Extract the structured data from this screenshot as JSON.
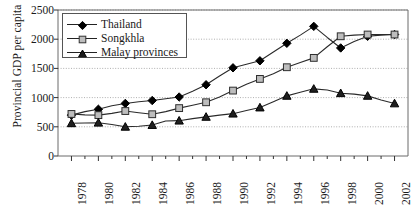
{
  "chart_data": {
    "type": "line",
    "title": "",
    "xlabel": "",
    "ylabel": "Provincial GDP per capita",
    "xlim": [
      1977,
      2003
    ],
    "ylim": [
      0,
      2500
    ],
    "grid": true,
    "legend_position": "top-left-inside",
    "y_ticks": [
      0,
      500,
      1000,
      1500,
      2000,
      2500
    ],
    "y_tick_labels": [
      "0",
      "500",
      "1000",
      "1500",
      "2000",
      "2500"
    ],
    "x_ticks": [
      1978,
      1980,
      1982,
      1984,
      1986,
      1988,
      1990,
      1992,
      1994,
      1996,
      1998,
      2000,
      2002
    ],
    "x_tick_labels": [
      "1978",
      "1980",
      "1982",
      "1984",
      "1986",
      "1988",
      "1990",
      "1992",
      "1994",
      "1996",
      "1998",
      "2000",
      "2002"
    ],
    "x": [
      1978,
      1979,
      1980,
      1981,
      1982,
      1983,
      1984,
      1985,
      1986,
      1987,
      1988,
      1989,
      1990,
      1991,
      1992,
      1993,
      1994,
      1995,
      1996,
      1997,
      1998,
      1999,
      2000,
      2001,
      2002
    ],
    "series": [
      {
        "name": "Thailand",
        "marker": "filled-diamond",
        "color": "#000000",
        "values": [
          700,
          760,
          800,
          860,
          900,
          930,
          950,
          980,
          1010,
          1110,
          1220,
          1370,
          1510,
          1570,
          1630,
          1780,
          1930,
          2070,
          2220,
          2030,
          1850,
          1960,
          2050,
          2070,
          2080
        ]
      },
      {
        "name": "Songkhla",
        "marker": "open-square",
        "color": "#888888",
        "values": [
          720,
          705,
          700,
          730,
          770,
          740,
          715,
          760,
          820,
          870,
          920,
          1010,
          1120,
          1230,
          1320,
          1410,
          1520,
          1600,
          1680,
          1870,
          2050,
          2070,
          2080,
          2080,
          2080
        ]
      },
      {
        "name": "Malay provinces",
        "marker": "filled-triangle",
        "color": "#000000",
        "values": [
          560,
          565,
          570,
          540,
          500,
          510,
          530,
          600,
          605,
          640,
          670,
          700,
          725,
          780,
          830,
          930,
          1030,
          1090,
          1150,
          1130,
          1075,
          1060,
          1030,
          960,
          900
        ]
      }
    ]
  }
}
